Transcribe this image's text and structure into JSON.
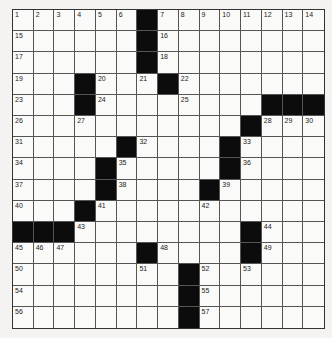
{
  "puzzle": {
    "rows": 15,
    "cols": 15,
    "blacks": [
      [
        0,
        6
      ],
      [
        1,
        6
      ],
      [
        2,
        6
      ],
      [
        3,
        3
      ],
      [
        3,
        7
      ],
      [
        4,
        3
      ],
      [
        4,
        12
      ],
      [
        4,
        13
      ],
      [
        4,
        14
      ],
      [
        5,
        11
      ],
      [
        6,
        5
      ],
      [
        6,
        10
      ],
      [
        7,
        4
      ],
      [
        7,
        10
      ],
      [
        8,
        4
      ],
      [
        8,
        9
      ],
      [
        9,
        3
      ],
      [
        10,
        0
      ],
      [
        10,
        1
      ],
      [
        10,
        2
      ],
      [
        10,
        11
      ],
      [
        11,
        6
      ],
      [
        11,
        11
      ],
      [
        12,
        8
      ],
      [
        13,
        8
      ],
      [
        14,
        8
      ]
    ],
    "numbers": [
      {
        "r": 0,
        "c": 0,
        "n": "1"
      },
      {
        "r": 0,
        "c": 1,
        "n": "2"
      },
      {
        "r": 0,
        "c": 2,
        "n": "3"
      },
      {
        "r": 0,
        "c": 3,
        "n": "4"
      },
      {
        "r": 0,
        "c": 4,
        "n": "5"
      },
      {
        "r": 0,
        "c": 5,
        "n": "6"
      },
      {
        "r": 0,
        "c": 7,
        "n": "7"
      },
      {
        "r": 0,
        "c": 8,
        "n": "8"
      },
      {
        "r": 0,
        "c": 9,
        "n": "9"
      },
      {
        "r": 0,
        "c": 10,
        "n": "10"
      },
      {
        "r": 0,
        "c": 11,
        "n": "11"
      },
      {
        "r": 0,
        "c": 12,
        "n": "12"
      },
      {
        "r": 0,
        "c": 13,
        "n": "13"
      },
      {
        "r": 0,
        "c": 14,
        "n": "14"
      },
      {
        "r": 1,
        "c": 0,
        "n": "15"
      },
      {
        "r": 1,
        "c": 7,
        "n": "16"
      },
      {
        "r": 2,
        "c": 0,
        "n": "17"
      },
      {
        "r": 2,
        "c": 7,
        "n": "18"
      },
      {
        "r": 3,
        "c": 0,
        "n": "19"
      },
      {
        "r": 3,
        "c": 4,
        "n": "20"
      },
      {
        "r": 3,
        "c": 6,
        "n": "21"
      },
      {
        "r": 3,
        "c": 8,
        "n": "22"
      },
      {
        "r": 4,
        "c": 0,
        "n": "23"
      },
      {
        "r": 4,
        "c": 4,
        "n": "24"
      },
      {
        "r": 4,
        "c": 8,
        "n": "25"
      },
      {
        "r": 5,
        "c": 0,
        "n": "26"
      },
      {
        "r": 5,
        "c": 3,
        "n": "27"
      },
      {
        "r": 5,
        "c": 12,
        "n": "28"
      },
      {
        "r": 5,
        "c": 13,
        "n": "29"
      },
      {
        "r": 5,
        "c": 14,
        "n": "30"
      },
      {
        "r": 6,
        "c": 0,
        "n": "31"
      },
      {
        "r": 6,
        "c": 6,
        "n": "32"
      },
      {
        "r": 6,
        "c": 11,
        "n": "33"
      },
      {
        "r": 7,
        "c": 0,
        "n": "34"
      },
      {
        "r": 7,
        "c": 5,
        "n": "35"
      },
      {
        "r": 7,
        "c": 11,
        "n": "36"
      },
      {
        "r": 8,
        "c": 0,
        "n": "37"
      },
      {
        "r": 8,
        "c": 5,
        "n": "38"
      },
      {
        "r": 8,
        "c": 10,
        "n": "39"
      },
      {
        "r": 9,
        "c": 0,
        "n": "40"
      },
      {
        "r": 9,
        "c": 4,
        "n": "41"
      },
      {
        "r": 9,
        "c": 9,
        "n": "42"
      },
      {
        "r": 10,
        "c": 3,
        "n": "43"
      },
      {
        "r": 10,
        "c": 12,
        "n": "44"
      },
      {
        "r": 11,
        "c": 0,
        "n": "45"
      },
      {
        "r": 11,
        "c": 1,
        "n": "46"
      },
      {
        "r": 11,
        "c": 2,
        "n": "47"
      },
      {
        "r": 11,
        "c": 7,
        "n": "48"
      },
      {
        "r": 11,
        "c": 12,
        "n": "49"
      },
      {
        "r": 12,
        "c": 0,
        "n": "50"
      },
      {
        "r": 12,
        "c": 6,
        "n": "51"
      },
      {
        "r": 12,
        "c": 9,
        "n": "52"
      },
      {
        "r": 12,
        "c": 11,
        "n": "53"
      },
      {
        "r": 13,
        "c": 0,
        "n": "54"
      },
      {
        "r": 13,
        "c": 9,
        "n": "55"
      },
      {
        "r": 14,
        "c": 0,
        "n": "56"
      },
      {
        "r": 14,
        "c": 9,
        "n": "57"
      }
    ]
  }
}
